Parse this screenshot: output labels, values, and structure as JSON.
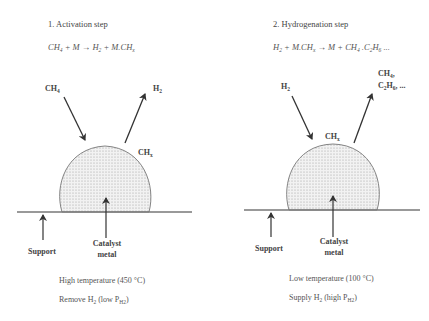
{
  "panels": [
    {
      "title": "1. Activation step",
      "equation": {
        "lhs": [
          "CH",
          "4",
          " + M → H",
          "2",
          " + M.CH",
          "x"
        ]
      },
      "inputs": [
        {
          "label": "CH",
          "sub": "4"
        }
      ],
      "outputs": [
        {
          "label": "H",
          "sub": "2"
        }
      ],
      "surface_species": {
        "label": "CH",
        "sub": "x"
      },
      "support_label": "Support",
      "catalyst_label_line1": "Catalyst",
      "catalyst_label_line2": "metal",
      "condition_1": "High temperature (450 °C)",
      "condition_2": {
        "pre": "Remove H",
        "sub1": "2",
        "mid": " (low P",
        "sub2": "H2",
        "post": ")"
      }
    },
    {
      "title": "2. Hydrogenation step",
      "equation": {
        "lhs": [
          "H",
          "2",
          " + M.CH",
          "x",
          " → M + CH",
          "4",
          " .C",
          "2",
          "H",
          "6",
          " ..."
        ]
      },
      "inputs": [
        {
          "label": "H",
          "sub": "2"
        }
      ],
      "outputs": [
        {
          "label": "CH",
          "sub": "4",
          "post": ","
        },
        {
          "label": "C",
          "sub": "2",
          "label2": "H",
          "sub2": "6",
          "post": ", ..."
        }
      ],
      "surface_species": {
        "label": "CH",
        "sub": "x"
      },
      "support_label": "Support",
      "catalyst_label_line1": "Catalyst",
      "catalyst_label_line2": "metal",
      "condition_1": "Low temperature (100 °C)",
      "condition_2": {
        "pre": "Supply H",
        "sub1": "2",
        "mid": " (high P",
        "sub2": "H2",
        "post": ")"
      }
    }
  ],
  "colors": {
    "line": "#555555",
    "dome_fill": "#eeeeee",
    "dot": "#9a9a9a"
  }
}
